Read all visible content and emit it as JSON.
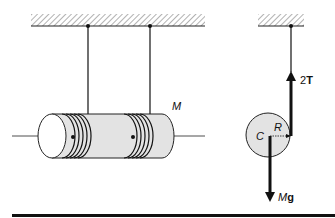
{
  "figure": {
    "left_panel": {
      "cylinder_label": "M",
      "description": "Cylinder suspended by two strings wound around it, hanging from ceiling"
    },
    "right_panel": {
      "center_label": "C",
      "radius_label": "R",
      "tension_label_num": "2",
      "tension_label_sym": "T",
      "weight_label_sym": "M",
      "weight_label_g": "g"
    },
    "colors": {
      "cylinder_fill": "#e3e3e3",
      "line": "#111111",
      "hatch": "#555555"
    }
  }
}
